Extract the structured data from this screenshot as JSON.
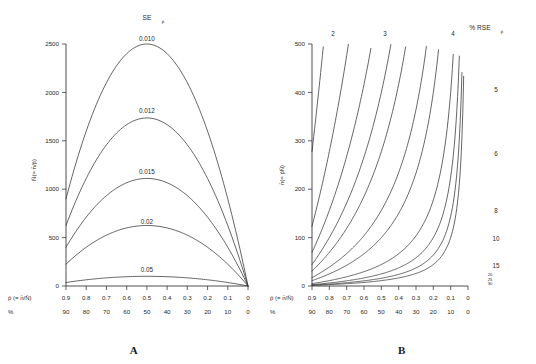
{
  "figure": {
    "panelA_caption": "A",
    "panelB_caption": "B"
  },
  "panelA": {
    "legend_title": "SE",
    "legend_title_sub": "p̄",
    "ylabel": "N̄(= n̄/p̄)",
    "xlabel": "p̄ (= n̄/N̄)",
    "xlabel2": "%",
    "yticks": [
      "0",
      "500",
      "1000",
      "1500",
      "2000",
      "2500"
    ],
    "xticks": [
      "0.9",
      "0.8",
      "0.7",
      "0.6",
      "0.5",
      "0.4",
      "0.3",
      "0.2",
      "0.1",
      "0"
    ],
    "xticks_pct": [
      "90",
      "80",
      "70",
      "60",
      "50",
      "40",
      "30",
      "20",
      "10",
      "0"
    ],
    "curve_labels": [
      "0.010",
      "0.012",
      "0.015",
      "0.02",
      "0.05"
    ]
  },
  "panelB": {
    "legend_title": "% RSE",
    "legend_title_sub": "p̄",
    "ylabel": "n̄(= p̄N̄)",
    "xlabel": "p̄ (= n̄/N̄)",
    "xlabel2": "%",
    "yticks": [
      "0",
      "100",
      "200",
      "300",
      "400",
      "500"
    ],
    "xticks": [
      "0.9",
      "0.8",
      "0.7",
      "0.6",
      "0.5",
      "0.4",
      "0.3",
      "0.2",
      "0.1",
      "0"
    ],
    "xticks_pct": [
      "90",
      "80",
      "70",
      "60",
      "50",
      "40",
      "30",
      "20",
      "10",
      "0"
    ],
    "line_labels": [
      "2",
      "3",
      "4",
      "5",
      "6",
      "8",
      "10",
      "15",
      "20",
      "25",
      "30"
    ]
  },
  "chart_data": [
    {
      "type": "line",
      "panel": "A",
      "title": "SE p̄",
      "xlabel": "p̄ (= n̄/N̄)",
      "ylabel": "N̄(= n̄/p̄)",
      "xlim": [
        0.9,
        0.0
      ],
      "ylim": [
        0,
        2500
      ],
      "x_axis_direction": "descending",
      "secondary_xlabel": "%",
      "secondary_xticks": [
        90,
        80,
        70,
        60,
        50,
        40,
        30,
        20,
        10,
        0
      ],
      "xticks": [
        0.9,
        0.8,
        0.7,
        0.6,
        0.5,
        0.4,
        0.3,
        0.2,
        0.1,
        0.0
      ],
      "yticks": [
        0,
        500,
        1000,
        1500,
        2000,
        2500
      ],
      "grid": false,
      "legend": "inline curve labels",
      "formula": "N = p(1-p)/SE^2",
      "series": [
        {
          "name": "0.010",
          "x": [
            0.9,
            0.8,
            0.7,
            0.6,
            0.5,
            0.4,
            0.3,
            0.2,
            0.1,
            0.0
          ],
          "values": [
            900,
            1600,
            2100,
            2400,
            2500,
            2400,
            2100,
            1600,
            900,
            0
          ]
        },
        {
          "name": "0.012",
          "x": [
            0.9,
            0.8,
            0.7,
            0.6,
            0.5,
            0.4,
            0.3,
            0.2,
            0.1,
            0.0
          ],
          "values": [
            625,
            1111,
            1458,
            1667,
            1736,
            1667,
            1458,
            1111,
            625,
            0
          ]
        },
        {
          "name": "0.015",
          "x": [
            0.9,
            0.8,
            0.7,
            0.6,
            0.5,
            0.4,
            0.3,
            0.2,
            0.1,
            0.0
          ],
          "values": [
            400,
            711,
            933,
            1067,
            1111,
            1067,
            933,
            711,
            400,
            0
          ]
        },
        {
          "name": "0.02",
          "x": [
            0.9,
            0.8,
            0.7,
            0.6,
            0.5,
            0.4,
            0.3,
            0.2,
            0.1,
            0.0
          ],
          "values": [
            225,
            400,
            525,
            600,
            625,
            600,
            525,
            400,
            225,
            0
          ]
        },
        {
          "name": "0.05",
          "x": [
            0.9,
            0.8,
            0.7,
            0.6,
            0.5,
            0.4,
            0.3,
            0.2,
            0.1,
            0.0
          ],
          "values": [
            36,
            64,
            84,
            96,
            100,
            96,
            84,
            64,
            36,
            0
          ]
        }
      ]
    },
    {
      "type": "line",
      "panel": "B",
      "title": "% RSE p̄",
      "xlabel": "p̄ (= n̄/N̄)",
      "ylabel": "n̄(= p̄N̄)",
      "xlim": [
        0.9,
        0.0
      ],
      "ylim": [
        0,
        500
      ],
      "x_axis_direction": "descending",
      "secondary_xlabel": "%",
      "secondary_xticks": [
        90,
        80,
        70,
        60,
        50,
        40,
        30,
        20,
        10,
        0
      ],
      "xticks": [
        0.9,
        0.8,
        0.7,
        0.6,
        0.5,
        0.4,
        0.3,
        0.2,
        0.1,
        0.0
      ],
      "yticks": [
        0,
        100,
        200,
        300,
        400,
        500
      ],
      "grid": false,
      "legend": "inline line labels",
      "formula": "n = (1-p)/(p * RSE^2)",
      "series": [
        {
          "name": "2",
          "x": [
            0.9,
            0.8,
            0.7,
            0.6,
            0.5,
            0.4,
            0.3,
            0.2,
            0.1,
            0.0
          ],
          "values": [
            278,
            625,
            1071,
            1667,
            2500,
            3750,
            5833,
            10000,
            22500,
            0
          ]
        },
        {
          "name": "3",
          "x": [
            0.9,
            0.8,
            0.7,
            0.6,
            0.5,
            0.4,
            0.3,
            0.2,
            0.1,
            0.0
          ],
          "values": [
            123,
            278,
            476,
            741,
            1111,
            1667,
            2593,
            4444,
            10000,
            0
          ]
        },
        {
          "name": "4",
          "x": [
            0.9,
            0.8,
            0.7,
            0.6,
            0.5,
            0.4,
            0.3,
            0.2,
            0.1,
            0.0
          ],
          "values": [
            69,
            156,
            268,
            417,
            625,
            938,
            1458,
            2500,
            5625,
            0
          ]
        },
        {
          "name": "5",
          "x": [
            0.9,
            0.8,
            0.7,
            0.6,
            0.5,
            0.4,
            0.3,
            0.2,
            0.1,
            0.0
          ],
          "values": [
            44,
            100,
            171,
            267,
            400,
            600,
            933,
            1600,
            3600,
            0
          ]
        },
        {
          "name": "6",
          "x": [
            0.9,
            0.8,
            0.7,
            0.6,
            0.5,
            0.4,
            0.3,
            0.2,
            0.1,
            0.0
          ],
          "values": [
            31,
            69,
            119,
            185,
            278,
            417,
            648,
            1111,
            2500,
            0
          ]
        },
        {
          "name": "8",
          "x": [
            0.9,
            0.8,
            0.7,
            0.6,
            0.5,
            0.4,
            0.3,
            0.2,
            0.1,
            0.0
          ],
          "values": [
            17,
            39,
            67,
            104,
            156,
            234,
            365,
            625,
            1406,
            0
          ]
        },
        {
          "name": "10",
          "x": [
            0.9,
            0.8,
            0.7,
            0.6,
            0.5,
            0.4,
            0.3,
            0.2,
            0.1,
            0.0
          ],
          "values": [
            11,
            25,
            43,
            67,
            100,
            150,
            233,
            400,
            900,
            0
          ]
        },
        {
          "name": "15",
          "x": [
            0.9,
            0.8,
            0.7,
            0.6,
            0.5,
            0.4,
            0.3,
            0.2,
            0.1,
            0.0
          ],
          "values": [
            5,
            11,
            19,
            30,
            44,
            67,
            104,
            178,
            400,
            0
          ]
        },
        {
          "name": "20",
          "x": [
            0.9,
            0.8,
            0.7,
            0.6,
            0.5,
            0.4,
            0.3,
            0.2,
            0.1,
            0.0
          ],
          "values": [
            3,
            6,
            11,
            17,
            25,
            38,
            58,
            100,
            225,
            0
          ]
        },
        {
          "name": "25",
          "x": [
            0.9,
            0.8,
            0.7,
            0.6,
            0.5,
            0.4,
            0.3,
            0.2,
            0.1,
            0.0
          ],
          "values": [
            2,
            4,
            7,
            11,
            16,
            24,
            37,
            64,
            144,
            0
          ]
        },
        {
          "name": "30",
          "x": [
            0.9,
            0.8,
            0.7,
            0.6,
            0.5,
            0.4,
            0.3,
            0.2,
            0.1,
            0.0
          ],
          "values": [
            1,
            3,
            5,
            7,
            11,
            17,
            26,
            44,
            100,
            0
          ]
        }
      ]
    }
  ]
}
